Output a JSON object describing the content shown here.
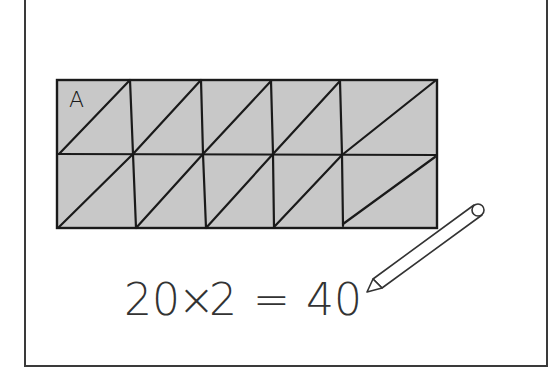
{
  "diagram": {
    "grid": {
      "columns": 5,
      "rows": 2,
      "fill": "#c8c8c8",
      "stroke": "#1a1a1a",
      "triangles_per_square": 2
    },
    "label": "A",
    "equation": {
      "left": "20",
      "op": "×",
      "right": "2",
      "equals": "=",
      "result": "40",
      "full": "20 × 2 = 40"
    },
    "icons": [
      "pencil-icon"
    ]
  }
}
